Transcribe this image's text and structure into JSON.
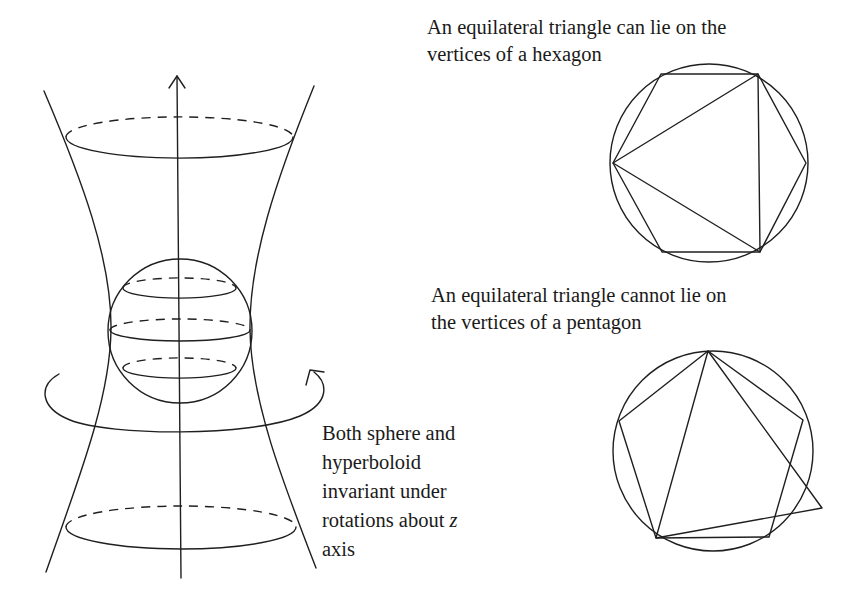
{
  "figure": {
    "left_panel": {
      "title": "Sphere inside hyperboloid of one sheet",
      "caption_lines": [
        "Both sphere and",
        "hyperboloid",
        "invariant under",
        "rotations about ",
        "axis"
      ],
      "axis_variable": "z",
      "elements": [
        "z-axis-arrow",
        "hyperboloid",
        "sphere",
        "top-circle",
        "bottom-circle",
        "rotation-arrow"
      ]
    },
    "hexagon_panel": {
      "caption_lines": [
        "An equilateral triangle can lie on the",
        "vertices of a hexagon"
      ],
      "polygon_sides": 6,
      "triangle_fits": true
    },
    "pentagon_panel": {
      "caption_lines": [
        "An equilateral triangle cannot lie on",
        "the vertices of a pentagon"
      ],
      "polygon_sides": 5,
      "triangle_fits": false
    }
  },
  "colors": {
    "background": "#ffffff",
    "ink": "#1f1f1f"
  }
}
